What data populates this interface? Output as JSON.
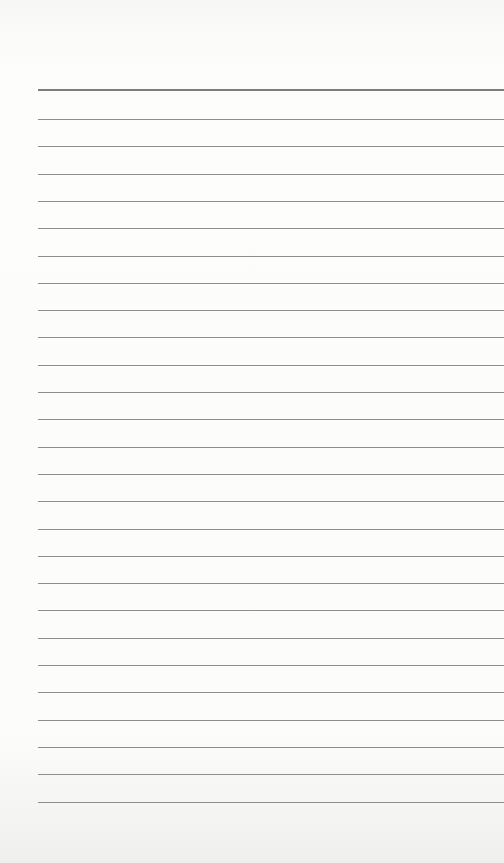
{
  "page": {
    "type": "lined-paper",
    "background_color": "#fbfbfa",
    "line_color": "#8e8e8e",
    "top_line_color": "#7d7d7d",
    "line_count": 27,
    "top_line_y": 89,
    "first_regular_line_y": 119,
    "line_spacing": 27.3,
    "left_margin": 38
  }
}
